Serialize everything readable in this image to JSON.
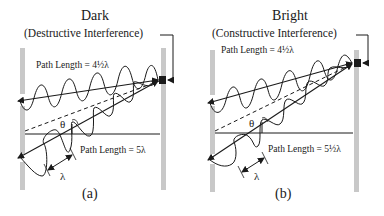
{
  "panels": [
    {
      "id": "a",
      "title": "Dark",
      "subtitle": "(Destructive Interference)",
      "path_top_label": "Path Length = 4½λ",
      "path_bottom_label": "Path Length = 5λ",
      "angle_label": "θ",
      "wavelength_label": "λ",
      "caption": "(a)"
    },
    {
      "id": "b",
      "title": "Bright",
      "subtitle": "(Constructive Interference)",
      "path_top_label": "Path Length = 4½λ",
      "path_bottom_label": "Path Length = 5½λ",
      "angle_label": "θ",
      "wavelength_label": "λ",
      "caption": "(b)"
    }
  ],
  "colors": {
    "barrier": "#c8c8c8",
    "ink": "#1a1a1a",
    "detector": "#1a1a1a",
    "background": "#ffffff"
  }
}
